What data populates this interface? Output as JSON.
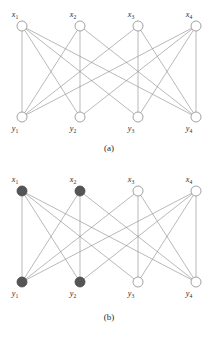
{
  "figure": {
    "background_color": "#ffffff",
    "edge_color": "#8a8a8a",
    "node_outline_color": "#8a8a8a",
    "node_open_fill": "#ffffff",
    "node_filled_fill": "#555555",
    "label_color": "#2b2b2b"
  },
  "geometry": {
    "node_radius": 5.0,
    "top_row_y": 26,
    "bottom_row_y": 117,
    "node_x_positions": [
      22,
      80,
      138,
      196
    ],
    "top_label_dy": -9,
    "bottom_label_dy": 14,
    "label_dx": -7
  },
  "graph": {
    "top_nodes": [
      "x1",
      "x2",
      "x3",
      "x4"
    ],
    "bottom_nodes": [
      "y1",
      "y2",
      "y3",
      "y4"
    ],
    "edges": [
      [
        0,
        1
      ],
      [
        0,
        2
      ],
      [
        0,
        3
      ],
      [
        1,
        0
      ],
      [
        1,
        3
      ],
      [
        2,
        0
      ],
      [
        2,
        3
      ],
      [
        3,
        0
      ],
      [
        3,
        1
      ],
      [
        3,
        2
      ],
      [
        0,
        0
      ],
      [
        1,
        1
      ],
      [
        2,
        2
      ],
      [
        3,
        3
      ]
    ],
    "edge_list_note": "14 edges between top row x-index and bottom row y-index"
  },
  "panels": [
    {
      "id": "a",
      "caption": "(a)",
      "caption_x": 109,
      "caption_y": 151,
      "top_labels": [
        {
          "base": "x",
          "sub": "1"
        },
        {
          "base": "x",
          "sub": "2"
        },
        {
          "base": "x",
          "sub": "3"
        },
        {
          "base": "x",
          "sub": "4"
        }
      ],
      "bottom_labels": [
        {
          "base": "y",
          "sub": "1"
        },
        {
          "base": "y",
          "sub": "2"
        },
        {
          "base": "y",
          "sub": "3"
        },
        {
          "base": "y",
          "sub": "4"
        }
      ],
      "top_filled": [
        false,
        false,
        false,
        false
      ],
      "bottom_filled": [
        false,
        false,
        false,
        false
      ]
    },
    {
      "id": "b",
      "caption": "(b)",
      "caption_x": 109,
      "caption_y": 155,
      "top_labels": [
        {
          "base": "x",
          "sub": "1"
        },
        {
          "base": "x",
          "sub": "2"
        },
        {
          "base": "x",
          "sub": "3"
        },
        {
          "base": "x",
          "sub": "4"
        }
      ],
      "bottom_labels": [
        {
          "base": "y",
          "sub": "1"
        },
        {
          "base": "y",
          "sub": "2"
        },
        {
          "base": "y",
          "sub": "3"
        },
        {
          "base": "y",
          "sub": "4"
        }
      ],
      "top_filled": [
        true,
        true,
        false,
        false
      ],
      "bottom_filled": [
        true,
        true,
        false,
        false
      ]
    }
  ]
}
